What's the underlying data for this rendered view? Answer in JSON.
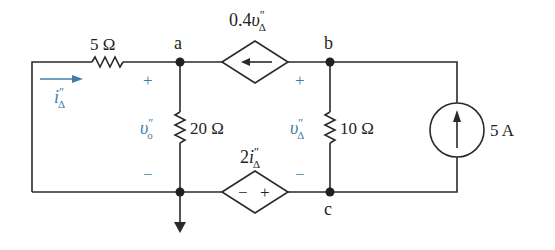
{
  "circuit": {
    "nodes": {
      "a": "a",
      "b": "b",
      "c": "c"
    },
    "components": {
      "r5": {
        "label": "5 Ω",
        "type": "resistor",
        "value_ohms": 5
      },
      "r20": {
        "label": "20 Ω",
        "type": "resistor",
        "value_ohms": 20
      },
      "r10": {
        "label": "10 Ω",
        "type": "resistor",
        "value_ohms": 10
      },
      "dep_current": {
        "label_main": "0.4",
        "label_var": "υ",
        "label_sup": "″",
        "label_sub": "Δ",
        "type": "dependent-current-source",
        "direction": "left"
      },
      "dep_voltage": {
        "label_main": "2",
        "label_var": "i",
        "label_sup": "″",
        "label_sub": "Δ",
        "type": "dependent-voltage-source",
        "polarity_left": "−",
        "polarity_right": "+"
      },
      "isrc": {
        "label": "5 A",
        "type": "independent-current-source",
        "direction": "up"
      }
    },
    "annotations": {
      "i_delta": {
        "var": "i",
        "sup": "″",
        "sub": "Δ"
      },
      "v_o": {
        "var": "υ",
        "sup": "″",
        "sub": "o"
      },
      "v_delta": {
        "var": "υ",
        "sup": "″",
        "sub": "Δ"
      },
      "plus": "+",
      "minus": "−"
    },
    "colors": {
      "wire": "#2a2a2a",
      "annotation": "#3f7fa6"
    }
  }
}
